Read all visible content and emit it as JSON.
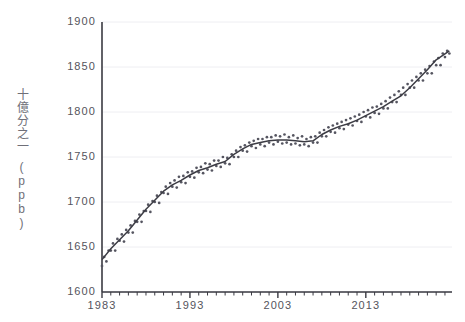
{
  "chart_data": {
    "type": "scatter",
    "title": "",
    "xlabel": "",
    "ylabel": "十億分之一",
    "ylabel_unit": "(ppb)",
    "xlim": [
      1983.0,
      2022.8
    ],
    "ylim": [
      1600,
      1900
    ],
    "ytick_values": [
      1900,
      1850,
      1800,
      1750,
      1700,
      1650,
      1600
    ],
    "ytick_labels": [
      "1900",
      "1850",
      "1800",
      "1750",
      "1700",
      "1650",
      "1600"
    ],
    "xtick_values": [
      1983,
      1993,
      2003,
      2013
    ],
    "xtick_labels": [
      "1983",
      "1993",
      "2003",
      "2013"
    ],
    "x_minor_tick_interval": 1,
    "grid": "horizontal-faint",
    "legend": "none",
    "marker_color": "#555560",
    "line_color": "#3c3c44",
    "axis_color": "#3a3a42",
    "background": "#ffffff",
    "series": [
      {
        "name": "monthly-observations",
        "role": "scatter",
        "x": [
          1983.0,
          1983.25,
          1983.5,
          1983.75,
          1984.0,
          1984.25,
          1984.5,
          1984.75,
          1985.0,
          1985.25,
          1985.5,
          1985.75,
          1986.0,
          1986.25,
          1986.5,
          1986.75,
          1987.0,
          1987.25,
          1987.5,
          1987.75,
          1988.0,
          1988.25,
          1988.5,
          1988.75,
          1989.0,
          1989.25,
          1989.5,
          1989.75,
          1990.0,
          1990.25,
          1990.5,
          1990.75,
          1991.0,
          1991.25,
          1991.5,
          1991.75,
          1992.0,
          1992.25,
          1992.5,
          1992.75,
          1993.0,
          1993.25,
          1993.5,
          1993.75,
          1994.0,
          1994.25,
          1994.5,
          1994.75,
          1995.0,
          1995.25,
          1995.5,
          1995.75,
          1996.0,
          1996.25,
          1996.5,
          1996.75,
          1997.0,
          1997.25,
          1997.5,
          1997.75,
          1998.0,
          1998.25,
          1998.5,
          1998.75,
          1999.0,
          1999.25,
          1999.5,
          1999.75,
          2000.0,
          2000.25,
          2000.5,
          2000.75,
          2001.0,
          2001.25,
          2001.5,
          2001.75,
          2002.0,
          2002.25,
          2002.5,
          2002.75,
          2003.0,
          2003.25,
          2003.5,
          2003.75,
          2004.0,
          2004.25,
          2004.5,
          2004.75,
          2005.0,
          2005.25,
          2005.5,
          2005.75,
          2006.0,
          2006.25,
          2006.5,
          2006.75,
          2007.0,
          2007.25,
          2007.5,
          2007.75,
          2008.0,
          2008.25,
          2008.5,
          2008.75,
          2009.0,
          2009.25,
          2009.5,
          2009.75,
          2010.0,
          2010.25,
          2010.5,
          2010.75,
          2011.0,
          2011.25,
          2011.5,
          2011.75,
          2012.0,
          2012.25,
          2012.5,
          2012.75,
          2013.0,
          2013.25,
          2013.5,
          2013.75,
          2014.0,
          2014.25,
          2014.5,
          2014.75,
          2015.0,
          2015.25,
          2015.5,
          2015.75,
          2016.0,
          2016.25,
          2016.5,
          2016.75,
          2017.0,
          2017.25,
          2017.5,
          2017.75,
          2018.0,
          2018.25,
          2018.5,
          2018.75,
          2019.0,
          2019.25,
          2019.5,
          2019.75,
          2020.0,
          2020.25,
          2020.5,
          2020.75,
          2021.0,
          2021.25,
          2021.5,
          2021.75,
          2022.0,
          2022.25,
          2022.5
        ],
        "y": [
          1629,
          1639,
          1634,
          1646,
          1646,
          1654,
          1646,
          1659,
          1657,
          1664,
          1656,
          1669,
          1666,
          1674,
          1666,
          1679,
          1678,
          1686,
          1678,
          1690,
          1690,
          1697,
          1689,
          1701,
          1700,
          1707,
          1699,
          1711,
          1710,
          1717,
          1709,
          1721,
          1717,
          1724,
          1716,
          1728,
          1722,
          1729,
          1721,
          1733,
          1728,
          1734,
          1727,
          1738,
          1733,
          1739,
          1732,
          1743,
          1736,
          1742,
          1735,
          1746,
          1740,
          1746,
          1739,
          1750,
          1743,
          1749,
          1742,
          1753,
          1750,
          1757,
          1750,
          1761,
          1757,
          1763,
          1756,
          1766,
          1762,
          1768,
          1760,
          1770,
          1764,
          1770,
          1762,
          1772,
          1766,
          1772,
          1764,
          1774,
          1767,
          1773,
          1765,
          1775,
          1766,
          1772,
          1764,
          1774,
          1765,
          1771,
          1763,
          1773,
          1764,
          1770,
          1762,
          1772,
          1766,
          1773,
          1766,
          1777,
          1773,
          1780,
          1773,
          1783,
          1778,
          1785,
          1777,
          1787,
          1782,
          1789,
          1781,
          1791,
          1786,
          1793,
          1785,
          1795,
          1790,
          1797,
          1789,
          1800,
          1795,
          1802,
          1794,
          1805,
          1799,
          1806,
          1798,
          1809,
          1804,
          1812,
          1804,
          1816,
          1811,
          1819,
          1811,
          1823,
          1819,
          1827,
          1819,
          1831,
          1827,
          1835,
          1827,
          1839,
          1835,
          1843,
          1835,
          1847,
          1843,
          1851,
          1843,
          1856,
          1852,
          1860,
          1852,
          1865,
          1861,
          1868,
          1865
        ]
      },
      {
        "name": "smoothed-trend",
        "role": "line",
        "x": [
          1983.0,
          1984.0,
          1985.0,
          1986.0,
          1987.0,
          1988.0,
          1989.0,
          1990.0,
          1991.0,
          1992.0,
          1993.0,
          1994.0,
          1995.0,
          1996.0,
          1997.0,
          1998.0,
          1999.0,
          2000.0,
          2001.0,
          2002.0,
          2003.0,
          2004.0,
          2005.0,
          2006.0,
          2007.0,
          2008.0,
          2009.0,
          2010.0,
          2011.0,
          2012.0,
          2013.0,
          2014.0,
          2015.0,
          2016.0,
          2017.0,
          2018.0,
          2019.0,
          2020.0,
          2021.0,
          2022.5
        ],
        "y": [
          1636,
          1648,
          1658,
          1668,
          1680,
          1692,
          1702,
          1712,
          1719,
          1724,
          1730,
          1735,
          1738,
          1742,
          1745,
          1753,
          1759,
          1764,
          1766,
          1768,
          1769,
          1769,
          1768,
          1767,
          1768,
          1775,
          1780,
          1784,
          1787,
          1791,
          1796,
          1801,
          1806,
          1812,
          1818,
          1827,
          1837,
          1847,
          1858,
          1868
        ]
      }
    ]
  }
}
